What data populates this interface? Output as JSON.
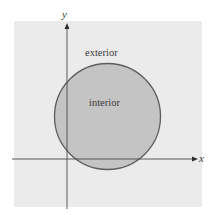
{
  "diagram": {
    "type": "set-region",
    "region_labels": {
      "exterior": "exterior",
      "interior": "interior"
    },
    "axes": {
      "x_label": "x",
      "y_label": "y"
    },
    "colors": {
      "background_panel": "#ebebeb",
      "circle_fill": "#c4c4c4",
      "circle_stroke": "#5e5e5e",
      "axis": "#4a4a4a",
      "text": "#3a3a3a"
    }
  }
}
